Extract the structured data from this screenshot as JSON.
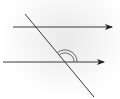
{
  "diagram": {
    "type": "parallel-lines-transversal",
    "colors": {
      "line": "#3a3a3a",
      "arrow": "#222222",
      "arc": "#555555",
      "background": "#ffffff"
    },
    "lines": [
      {
        "name": "upper-parallel-line",
        "x1": 13,
        "y1": 27,
        "x2": 112,
        "y2": 27,
        "arrow": "right"
      },
      {
        "name": "lower-parallel-line",
        "x1": 3,
        "y1": 62,
        "x2": 104,
        "y2": 62,
        "arrow": "right"
      }
    ],
    "transversal": {
      "x1": 25,
      "y1": 14,
      "x2": 94,
      "y2": 97
    },
    "angle_marker": {
      "center_x": 65,
      "center_y": 62,
      "radii": [
        9,
        12
      ],
      "style": "double-arc"
    }
  }
}
